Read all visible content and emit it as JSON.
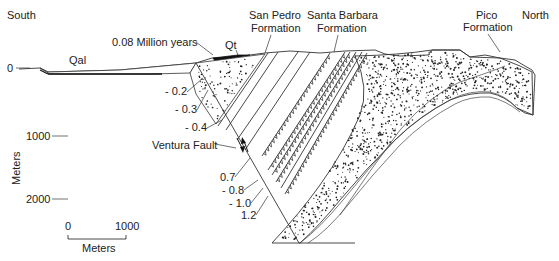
{
  "diagram": {
    "orientation": {
      "left": "South",
      "right": "North"
    },
    "units": [
      {
        "id": "qal",
        "label": "Qal"
      },
      {
        "id": "qt",
        "label": "Qt"
      },
      {
        "id": "san-pedro",
        "label": "San Pedro\nFormation",
        "line1": "San Pedro",
        "line2": "Formation"
      },
      {
        "id": "santa-barbara",
        "label": "Santa Barbara\nFormation",
        "line1": "Santa Barbara",
        "line2": "Formation"
      },
      {
        "id": "pico",
        "label": "Pico\nFormation",
        "line1": "Pico",
        "line2": "Formation"
      }
    ],
    "fault": {
      "label": "Ventura Fault"
    },
    "age_annotation": "0.08 Million years",
    "age_markers": [
      "- 0.2",
      "- 0.3",
      "- 0.4",
      "0.7",
      "- 0.8",
      "- 1.0",
      "1.2"
    ],
    "depth_axis": {
      "label": "Meters",
      "ticks": [
        "0",
        "1000",
        "2000"
      ]
    },
    "scale_bar": {
      "label": "Meters",
      "start": "0",
      "end": "1000"
    }
  }
}
